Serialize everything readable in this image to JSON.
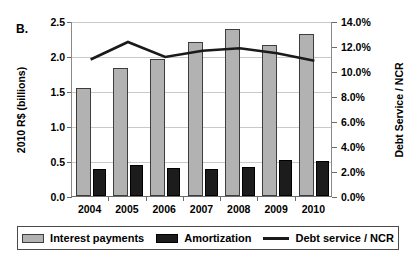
{
  "panel": {
    "label": "B."
  },
  "chart_data": {
    "type": "bar",
    "title": "",
    "subtitle": "",
    "panel_label": "B.",
    "categories": [
      "2004",
      "2005",
      "2006",
      "2007",
      "2008",
      "2009",
      "2010"
    ],
    "xlabel": "",
    "ylabel": "2010 R$ (billions)",
    "y2label": "Debt Service / NCR",
    "ylim": [
      0.0,
      2.5
    ],
    "y2lim": [
      0.0,
      14.0
    ],
    "yticks": [
      "0.0",
      "0.5",
      "1.0",
      "1.5",
      "2.0",
      "2.5"
    ],
    "ytick_values": [
      0.0,
      0.5,
      1.0,
      1.5,
      2.0,
      2.5
    ],
    "y2ticks": [
      "0.0%",
      "2.0%",
      "4.0%",
      "6.0%",
      "8.0%",
      "10.0%",
      "12.0%",
      "14.0%"
    ],
    "y2tick_values": [
      0.0,
      2.0,
      4.0,
      6.0,
      8.0,
      10.0,
      12.0,
      14.0
    ],
    "grid": true,
    "legend_position": "bottom",
    "series": [
      {
        "name": "Interest payments",
        "type": "bar",
        "axis": "left",
        "color": "#b2b2b2",
        "edge_color": "#3d3d3d",
        "values": [
          1.55,
          1.83,
          1.96,
          2.2,
          2.38,
          2.16,
          2.32
        ]
      },
      {
        "name": "Amortization",
        "type": "bar",
        "axis": "left",
        "color": "#1c1c1c",
        "edge_color": "#000000",
        "values": [
          0.38,
          0.44,
          0.4,
          0.38,
          0.41,
          0.52,
          0.5
        ]
      },
      {
        "name": "Debt service / NCR",
        "type": "line",
        "axis": "right",
        "color": "#1a1a1a",
        "values": [
          11.0,
          12.4,
          11.2,
          11.7,
          11.9,
          11.5,
          10.9
        ]
      }
    ]
  },
  "legend": {
    "items": [
      {
        "label": "Interest payments",
        "marker": "box-light-gray"
      },
      {
        "label": "Amortization",
        "marker": "box-dark"
      },
      {
        "label": "Debt service / NCR",
        "marker": "line-dark"
      }
    ]
  },
  "colors": {
    "interest": "#b2b2b2",
    "amortization": "#1c1c1c",
    "line": "#1a1a1a",
    "grid": "#c9c9c9",
    "axis": "#6b6b6b"
  }
}
